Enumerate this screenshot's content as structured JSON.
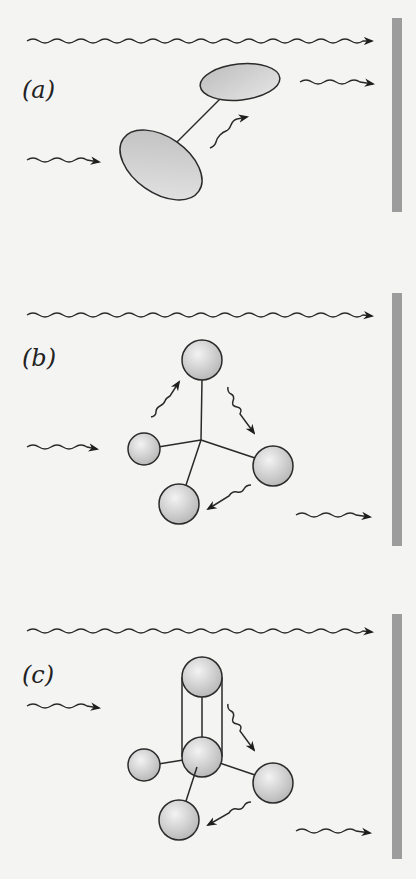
{
  "figure": {
    "background": "#f4f4f2",
    "stroke_color": "#2a2a2a",
    "fill_gradient": [
      "#f2f2f2",
      "#bdbdbd"
    ],
    "detector_color": "#9c9c9c",
    "panels": [
      {
        "id": "a",
        "label": "(a)",
        "molecule": "diatomic (two ellipsoids)"
      },
      {
        "id": "b",
        "label": "(b)",
        "molecule": "tetrahedral (four spheres)"
      },
      {
        "id": "c",
        "label": "(c)",
        "molecule": "tetrahedral with extra sphere bound (five spheres)"
      }
    ]
  }
}
